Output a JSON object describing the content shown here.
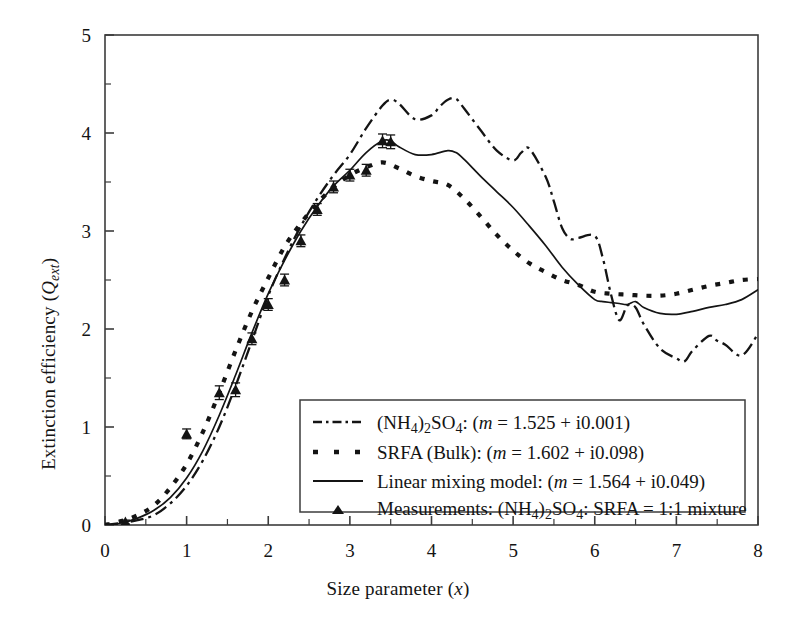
{
  "figure": {
    "background": "#ffffff",
    "line_color": "#141414",
    "frame_color": "#3c3c3c"
  },
  "axes": {
    "x": {
      "label_plain": "Size parameter (x)",
      "label_main": "Size parameter (",
      "label_var": "x",
      "label_tail": ")",
      "min": 0,
      "max": 8,
      "ticks": [
        0,
        1,
        2,
        3,
        4,
        5,
        6,
        7,
        8
      ],
      "tick_labels": [
        "0",
        "1",
        "2",
        "3",
        "4",
        "5",
        "6",
        "7",
        "8"
      ],
      "minor_step": 0.5
    },
    "y": {
      "label_plain": "Extinction efficiency (Qext)",
      "label_main": "Extinction efficiency (",
      "label_var": "Q",
      "label_sub": "ext",
      "label_tail": ")",
      "min": 0,
      "max": 5,
      "ticks": [
        0,
        1,
        2,
        3,
        4,
        5
      ],
      "tick_labels": [
        "0",
        "1",
        "2",
        "3",
        "4",
        "5"
      ],
      "minor_step": 0.5
    }
  },
  "legend": {
    "position": "inside-bottom-center",
    "entries": [
      {
        "marker": "dash-dot-line",
        "text_plain": "(NH4)2SO4: (m = 1.525 + i0.001)",
        "pre": "(NH",
        "sub1": "4",
        "mid": ")",
        "sub2": "2",
        "mid2": "SO",
        "sub3": "4",
        "post": ": (",
        "var": "m",
        "tail": " = 1.525 + i0.001)"
      },
      {
        "marker": "dotted-line",
        "text_plain": "SRFA (Bulk): (m = 1.602 + i0.098)",
        "pre": "SRFA (Bulk): (",
        "var": "m",
        "tail": " = 1.602 + i0.098)"
      },
      {
        "marker": "solid-line",
        "text_plain": "Linear mixing model: (m = 1.564 + i0.049)",
        "pre": "Linear mixing model: (",
        "var": "m",
        "tail": " = 1.564 + i0.049)"
      },
      {
        "marker": "triangle",
        "text_plain": "Measurements: (NH4)2SO4: SRFA = 1:1 mixture",
        "pre": "Measurements: (NH",
        "sub1": "4",
        "mid": ")",
        "sub2": "2",
        "mid2": "SO",
        "sub3": "4",
        "post": ": SRFA = 1:1 mixture"
      }
    ]
  },
  "chart_data": {
    "type": "line",
    "title": "",
    "xlabel": "Size parameter (x)",
    "ylabel": "Extinction efficiency (Q_ext)",
    "xlim": [
      0,
      8
    ],
    "ylim": [
      0,
      5
    ],
    "grid": false,
    "legend_position": "inside lower center",
    "series": [
      {
        "name": "(NH4)2SO4: (m = 1.525 + i0.001)",
        "style": "dash-dot",
        "x": [
          0.0,
          0.2,
          0.4,
          0.6,
          0.8,
          1.0,
          1.2,
          1.4,
          1.6,
          1.8,
          2.0,
          2.2,
          2.4,
          2.6,
          2.8,
          3.0,
          3.2,
          3.4,
          3.5,
          3.6,
          3.8,
          4.0,
          4.1,
          4.2,
          4.3,
          4.4,
          4.6,
          4.8,
          5.0,
          5.1,
          5.2,
          5.4,
          5.5,
          5.6,
          5.7,
          5.8,
          6.0,
          6.1,
          6.2,
          6.3,
          6.4,
          6.5,
          6.6,
          6.8,
          7.0,
          7.1,
          7.2,
          7.4,
          7.5,
          7.6,
          7.8,
          8.0
        ],
        "y": [
          0.0,
          0.02,
          0.05,
          0.1,
          0.22,
          0.4,
          0.66,
          1.0,
          1.42,
          1.88,
          2.34,
          2.72,
          3.05,
          3.33,
          3.57,
          3.78,
          4.05,
          4.28,
          4.34,
          4.3,
          4.14,
          4.18,
          4.27,
          4.34,
          4.35,
          4.25,
          4.03,
          3.82,
          3.72,
          3.8,
          3.84,
          3.55,
          3.3,
          3.03,
          2.92,
          2.93,
          2.95,
          2.72,
          2.35,
          2.09,
          2.24,
          2.22,
          2.05,
          1.8,
          1.7,
          1.67,
          1.78,
          1.93,
          1.88,
          1.84,
          1.73,
          1.95
        ]
      },
      {
        "name": "SRFA (Bulk): (m = 1.602 + i0.098)",
        "style": "dotted",
        "x": [
          0.0,
          0.2,
          0.4,
          0.6,
          0.8,
          1.0,
          1.2,
          1.4,
          1.6,
          1.8,
          2.0,
          2.2,
          2.4,
          2.6,
          2.8,
          3.0,
          3.2,
          3.4,
          3.6,
          3.8,
          4.0,
          4.2,
          4.4,
          4.6,
          4.8,
          5.0,
          5.2,
          5.4,
          5.6,
          5.8,
          6.0,
          6.2,
          6.4,
          6.6,
          6.8,
          7.0,
          7.2,
          7.4,
          7.6,
          7.8,
          8.0
        ],
        "y": [
          0.0,
          0.04,
          0.1,
          0.2,
          0.38,
          0.62,
          0.95,
          1.35,
          1.78,
          2.18,
          2.52,
          2.84,
          3.08,
          3.28,
          3.45,
          3.57,
          3.65,
          3.7,
          3.64,
          3.56,
          3.51,
          3.47,
          3.33,
          3.15,
          2.96,
          2.8,
          2.67,
          2.58,
          2.5,
          2.45,
          2.38,
          2.36,
          2.35,
          2.34,
          2.34,
          2.36,
          2.4,
          2.44,
          2.47,
          2.5,
          2.51
        ]
      },
      {
        "name": "Linear mixing model: (m = 1.564 + i0.049)",
        "style": "solid",
        "x": [
          0.0,
          0.2,
          0.4,
          0.6,
          0.8,
          1.0,
          1.2,
          1.4,
          1.6,
          1.8,
          2.0,
          2.2,
          2.4,
          2.6,
          2.8,
          3.0,
          3.2,
          3.4,
          3.5,
          3.6,
          3.8,
          4.0,
          4.2,
          4.3,
          4.4,
          4.6,
          4.8,
          5.0,
          5.2,
          5.4,
          5.6,
          5.8,
          6.0,
          6.1,
          6.2,
          6.3,
          6.4,
          6.5,
          6.6,
          6.8,
          7.0,
          7.2,
          7.4,
          7.6,
          7.8,
          8.0
        ],
        "y": [
          0.0,
          0.02,
          0.07,
          0.15,
          0.28,
          0.48,
          0.76,
          1.12,
          1.53,
          1.96,
          2.36,
          2.7,
          3.0,
          3.25,
          3.46,
          3.62,
          3.8,
          3.92,
          3.92,
          3.86,
          3.78,
          3.78,
          3.82,
          3.8,
          3.73,
          3.56,
          3.4,
          3.24,
          3.05,
          2.85,
          2.63,
          2.45,
          2.3,
          2.28,
          2.27,
          2.26,
          2.25,
          2.28,
          2.22,
          2.16,
          2.15,
          2.18,
          2.22,
          2.25,
          2.3,
          2.4
        ]
      }
    ],
    "measurements": {
      "name": "Measurements: (NH4)2SO4: SRFA = 1:1 mixture",
      "style": "triangle-with-errorbars",
      "x": [
        0.25,
        1.0,
        1.4,
        1.6,
        1.8,
        2.0,
        2.2,
        2.4,
        2.6,
        2.8,
        3.0,
        3.2,
        3.4,
        3.5
      ],
      "y": [
        0.03,
        0.93,
        1.35,
        1.38,
        1.9,
        2.25,
        2.5,
        2.9,
        3.22,
        3.45,
        3.57,
        3.62,
        3.92,
        3.91
      ],
      "yerr": [
        0.02,
        0.05,
        0.07,
        0.07,
        0.06,
        0.06,
        0.06,
        0.06,
        0.06,
        0.06,
        0.06,
        0.06,
        0.07,
        0.07
      ]
    }
  }
}
